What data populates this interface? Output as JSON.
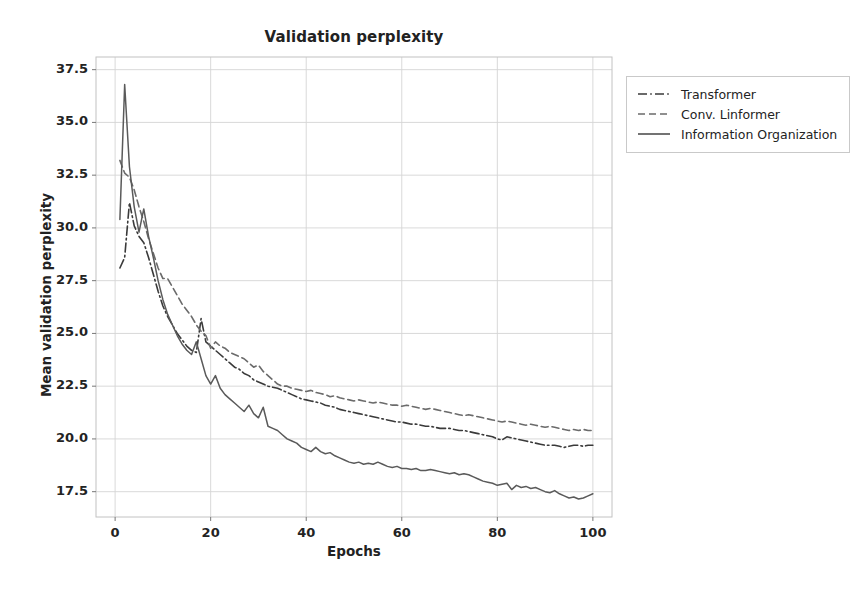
{
  "chart_data": {
    "type": "line",
    "title": "Validation perplexity",
    "xlabel": "Epochs",
    "ylabel": "Mean validation perplexity",
    "xlim": [
      -4,
      104
    ],
    "ylim": [
      16.3,
      38.1
    ],
    "xticks": [
      0,
      20,
      40,
      60,
      80,
      100
    ],
    "yticks": [
      17.5,
      20.0,
      22.5,
      25.0,
      27.5,
      30.0,
      32.5,
      35.0,
      37.5
    ],
    "xtick_labels": [
      "0",
      "20",
      "40",
      "60",
      "80",
      "100"
    ],
    "ytick_labels": [
      "17.5",
      "20.0",
      "22.5",
      "25.0",
      "27.5",
      "30.0",
      "32.5",
      "35.0",
      "37.5"
    ],
    "grid": true,
    "legend_position": "upper right outside",
    "x": [
      1,
      2,
      3,
      4,
      5,
      6,
      7,
      8,
      9,
      10,
      11,
      12,
      13,
      14,
      15,
      16,
      17,
      18,
      19,
      20,
      21,
      22,
      23,
      24,
      25,
      26,
      27,
      28,
      29,
      30,
      31,
      32,
      33,
      34,
      35,
      36,
      37,
      38,
      39,
      40,
      41,
      42,
      43,
      44,
      45,
      46,
      47,
      48,
      49,
      50,
      51,
      52,
      53,
      54,
      55,
      56,
      57,
      58,
      59,
      60,
      61,
      62,
      63,
      64,
      65,
      66,
      67,
      68,
      69,
      70,
      71,
      72,
      73,
      74,
      75,
      76,
      77,
      78,
      79,
      80,
      81,
      82,
      83,
      84,
      85,
      86,
      87,
      88,
      89,
      90,
      91,
      92,
      93,
      94,
      95,
      96,
      97,
      98,
      99,
      100
    ],
    "series": [
      {
        "name": "Transformer",
        "style": "dashdot",
        "color": "#3a3a3a",
        "values": [
          28.1,
          28.6,
          31.2,
          30.1,
          29.6,
          29.3,
          28.6,
          27.8,
          27.0,
          26.3,
          25.8,
          25.4,
          25.0,
          24.7,
          24.4,
          24.2,
          24.1,
          25.7,
          24.6,
          24.4,
          24.2,
          24.0,
          23.8,
          23.6,
          23.4,
          23.3,
          23.1,
          23.0,
          22.8,
          22.7,
          22.6,
          22.5,
          22.45,
          22.4,
          22.3,
          22.2,
          22.1,
          22.0,
          21.9,
          21.85,
          21.8,
          21.75,
          21.7,
          21.6,
          21.55,
          21.5,
          21.4,
          21.35,
          21.3,
          21.25,
          21.2,
          21.15,
          21.1,
          21.05,
          21.0,
          20.95,
          20.9,
          20.85,
          20.8,
          20.8,
          20.75,
          20.7,
          20.7,
          20.65,
          20.6,
          20.6,
          20.55,
          20.5,
          20.5,
          20.5,
          20.45,
          20.4,
          20.4,
          20.35,
          20.3,
          20.25,
          20.2,
          20.15,
          20.1,
          20.0,
          19.95,
          20.1,
          20.05,
          20.0,
          19.95,
          19.9,
          19.85,
          19.8,
          19.75,
          19.7,
          19.7,
          19.7,
          19.65,
          19.6,
          19.65,
          19.7,
          19.7,
          19.65,
          19.7,
          19.7
        ]
      },
      {
        "name": "Conv. Linformer",
        "style": "dashed",
        "color": "#6b6b6b",
        "values": [
          33.2,
          32.6,
          32.4,
          31.8,
          31.0,
          30.3,
          29.5,
          28.8,
          28.1,
          27.6,
          27.6,
          27.2,
          26.8,
          26.4,
          26.1,
          25.8,
          25.4,
          25.1,
          24.9,
          24.3,
          24.6,
          24.4,
          24.3,
          24.1,
          24.0,
          23.9,
          23.8,
          23.6,
          23.4,
          23.5,
          23.2,
          23.0,
          22.8,
          22.6,
          22.5,
          22.5,
          22.4,
          22.35,
          22.3,
          22.25,
          22.3,
          22.2,
          22.15,
          22.1,
          22.0,
          22.05,
          21.95,
          21.9,
          21.85,
          21.8,
          21.85,
          21.8,
          21.75,
          21.7,
          21.75,
          21.7,
          21.65,
          21.6,
          21.6,
          21.55,
          21.6,
          21.55,
          21.5,
          21.45,
          21.4,
          21.45,
          21.4,
          21.35,
          21.3,
          21.25,
          21.2,
          21.15,
          21.1,
          21.15,
          21.1,
          21.05,
          21.0,
          20.95,
          20.9,
          20.85,
          20.8,
          20.85,
          20.8,
          20.75,
          20.7,
          20.65,
          20.7,
          20.65,
          20.6,
          20.55,
          20.6,
          20.55,
          20.5,
          20.45,
          20.4,
          20.45,
          20.4,
          20.45,
          20.4,
          20.4
        ]
      },
      {
        "name": "Information Organization",
        "style": "solid",
        "color": "#5a5a5a",
        "values": [
          30.4,
          36.8,
          32.9,
          31.0,
          29.8,
          30.9,
          29.6,
          28.6,
          27.5,
          26.6,
          25.9,
          25.4,
          24.9,
          24.5,
          24.2,
          24.0,
          24.6,
          23.8,
          23.0,
          22.6,
          23.0,
          22.4,
          22.1,
          21.9,
          21.7,
          21.5,
          21.3,
          21.6,
          21.2,
          21.0,
          21.5,
          20.6,
          20.5,
          20.4,
          20.2,
          20.0,
          19.9,
          19.8,
          19.6,
          19.5,
          19.4,
          19.6,
          19.4,
          19.3,
          19.35,
          19.2,
          19.1,
          19.0,
          18.9,
          18.85,
          18.9,
          18.8,
          18.85,
          18.8,
          18.9,
          18.8,
          18.7,
          18.65,
          18.7,
          18.6,
          18.6,
          18.55,
          18.6,
          18.5,
          18.5,
          18.55,
          18.5,
          18.45,
          18.4,
          18.35,
          18.4,
          18.3,
          18.35,
          18.3,
          18.2,
          18.1,
          18.0,
          17.95,
          17.9,
          17.8,
          17.85,
          17.9,
          17.6,
          17.8,
          17.7,
          17.75,
          17.65,
          17.7,
          17.6,
          17.5,
          17.45,
          17.55,
          17.4,
          17.3,
          17.2,
          17.25,
          17.15,
          17.2,
          17.3,
          17.4
        ]
      }
    ]
  },
  "legend": {
    "entries": [
      {
        "label": "Transformer"
      },
      {
        "label": "Conv. Linformer"
      },
      {
        "label": "Information Organization"
      }
    ]
  }
}
